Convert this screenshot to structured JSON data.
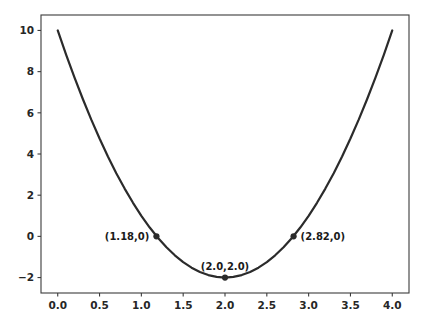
{
  "chart_data": {
    "type": "line",
    "title": "",
    "xlabel": "",
    "ylabel": "",
    "xlim": [
      -0.2,
      4.2
    ],
    "ylim": [
      -2.75,
      10.75
    ],
    "grid": false,
    "legend": null,
    "xticks": [
      "0.0",
      "0.5",
      "1.0",
      "1.5",
      "2.0",
      "2.5",
      "3.0",
      "3.5",
      "4.0"
    ],
    "xtick_values": [
      0.0,
      0.5,
      1.0,
      1.5,
      2.0,
      2.5,
      3.0,
      3.5,
      4.0
    ],
    "yticks": [
      "10",
      "8",
      "6",
      "4",
      "2",
      "0",
      "−2"
    ],
    "ytick_values": [
      10,
      8,
      6,
      4,
      2,
      0,
      -2
    ],
    "series": [
      {
        "name": "parabola",
        "equation": "y = 3(x - 2)^2 - 2",
        "color": "#2b2b2b",
        "linewidth": 2.2,
        "x": [
          0.0,
          0.1,
          0.2,
          0.3,
          0.4,
          0.5,
          0.6,
          0.7,
          0.8,
          0.9,
          1.0,
          1.1,
          1.2,
          1.3,
          1.4,
          1.5,
          1.6,
          1.7,
          1.8,
          1.9,
          2.0,
          2.1,
          2.2,
          2.3,
          2.4,
          2.5,
          2.6,
          2.7,
          2.8,
          2.9,
          3.0,
          3.1,
          3.2,
          3.3,
          3.4,
          3.5,
          3.6,
          3.7,
          3.8,
          3.9,
          4.0
        ],
        "y": [
          10.0,
          8.83,
          7.72,
          6.67,
          5.68,
          4.75,
          3.88,
          3.07,
          2.32,
          1.63,
          1.0,
          0.43,
          -0.08,
          -0.53,
          -0.92,
          -1.25,
          -1.52,
          -1.73,
          -1.88,
          -1.97,
          -2.0,
          -1.97,
          -1.88,
          -1.73,
          -1.52,
          -1.25,
          -0.92,
          -0.53,
          -0.08,
          0.43,
          1.0,
          1.63,
          2.32,
          3.07,
          3.88,
          4.75,
          5.68,
          6.67,
          7.72,
          8.83,
          10.0
        ]
      }
    ],
    "markers": [
      {
        "name": "left-root",
        "x": 1.18,
        "y": 0.0,
        "label": "(1.18,0)",
        "label_side": "left"
      },
      {
        "name": "vertex",
        "x": 2.0,
        "y": -2.0,
        "label": "(2.0,2.0)",
        "label_side": "above"
      },
      {
        "name": "right-root",
        "x": 2.82,
        "y": 0.0,
        "label": "(2.82,0)",
        "label_side": "right"
      }
    ],
    "colors": {
      "background": "#ffffff",
      "curve": "#2b2b2b",
      "axis": "#3b3b3b",
      "text": "#262626",
      "marker": "#2b2b2b"
    }
  }
}
